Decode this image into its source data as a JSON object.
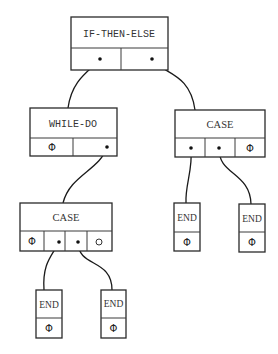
{
  "diagram": {
    "type": "tree",
    "nodes": {
      "root": {
        "label": "IF-THEN-ELSE",
        "slots": [
          "•",
          "•"
        ]
      },
      "while": {
        "label": "WHILE-DO",
        "slots": [
          "Φ",
          "•"
        ]
      },
      "case_right": {
        "label": "CASE",
        "slots": [
          "•",
          "•",
          "Φ"
        ]
      },
      "case_left": {
        "label": "CASE",
        "slots": [
          "Φ",
          "•",
          "•",
          "○"
        ]
      },
      "end_r1": {
        "label": "END",
        "slots": [
          "Φ"
        ]
      },
      "end_r2": {
        "label": "END",
        "slots": [
          "Φ"
        ]
      },
      "end_b1": {
        "label": "END",
        "slots": [
          "Φ"
        ]
      },
      "end_b2": {
        "label": "END",
        "slots": [
          "Φ"
        ]
      }
    },
    "edges": [
      [
        "root.slot1",
        "while"
      ],
      [
        "root.slot2",
        "case_right"
      ],
      [
        "while.slot2",
        "case_left"
      ],
      [
        "case_right.slot1",
        "end_r1"
      ],
      [
        "case_right.slot2",
        "end_r2"
      ],
      [
        "case_left.slot2",
        "end_b1"
      ],
      [
        "case_left.slot3",
        "end_b2"
      ]
    ]
  }
}
